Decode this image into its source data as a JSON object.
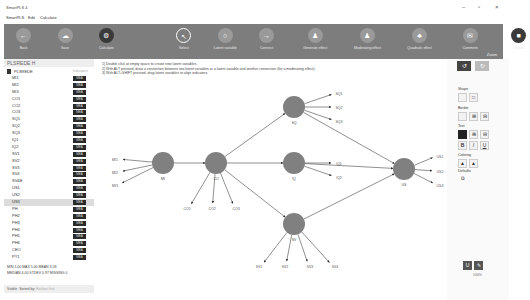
{
  "window": {
    "title": "SmartPLS 4",
    "controls": [
      "minimize",
      "maximize",
      "close"
    ]
  },
  "menu": [
    "SmartPLS",
    "Edit",
    "Calculate"
  ],
  "toolbar": {
    "buttons": [
      {
        "label": "Back",
        "icon": "back"
      },
      {
        "label": "Save",
        "icon": "cloud"
      },
      {
        "label": "Calculate",
        "icon": "gear",
        "dark": true
      },
      {
        "label": "Select",
        "icon": "pointer",
        "selected": true
      },
      {
        "label": "Latent variable",
        "icon": "circle"
      },
      {
        "label": "Connect",
        "icon": "arrow"
      },
      {
        "label": "Generate effect",
        "icon": "person"
      },
      {
        "label": "Moderating effect",
        "icon": "person"
      },
      {
        "label": "Quadratic effect",
        "icon": "group"
      },
      {
        "label": "Comment",
        "icon": "comment"
      },
      {
        "label": "Delete",
        "icon": "trash",
        "dark": true
      }
    ],
    "zoom_label": "Zoom"
  },
  "left": {
    "title": "PLSREDE H",
    "project": "PLSREDE",
    "project_right": "Indicators",
    "indicators": [
      "MI1",
      "MI2",
      "MI3",
      "CO1",
      "CO2",
      "CO3",
      "SQ1",
      "SQ2",
      "SQ3",
      "IQ1",
      "IQ2",
      "SV1",
      "SV2",
      "SV3",
      "SV4",
      "SV&E",
      "US1",
      "US2",
      "US3",
      "PH",
      "PH2",
      "PH3",
      "PH4",
      "PH5",
      "PH6",
      "CEO",
      "PY1"
    ],
    "badge": "MEA",
    "highlighted": "US3",
    "stats": {
      "line1": "MIN 1.00  MAX 5.00  MEAN 3.58",
      "line2": "MEDIAN 4.00  STDEV 0.97  MISSING 0"
    },
    "sort": {
      "visible": "Visible",
      "sorted": "Sorted by:",
      "value": "Earliest first"
    }
  },
  "canvas": {
    "instructions": [
      "1) Double click at empty space to create new latent variables.",
      "2) With ALT pressed, draw a connection between two latent variables or a latent variable and another connection (for a moderating effect).",
      "3) With ALT+SHIFT pressed, drag latent variables to align indicators."
    ],
    "nodes": [
      {
        "id": "MI",
        "x": 68,
        "y": 104
      },
      {
        "id": "CO",
        "x": 121,
        "y": 104
      },
      {
        "id": "SQ",
        "x": 199,
        "y": 48
      },
      {
        "id": "IQ",
        "x": 199,
        "y": 104
      },
      {
        "id": "US",
        "x": 309,
        "y": 110
      },
      {
        "id": "SV",
        "x": 199,
        "y": 165
      }
    ],
    "indicators": [
      {
        "id": "MI1",
        "x": 20,
        "y": 100,
        "lv": "MI"
      },
      {
        "id": "MI2",
        "x": 20,
        "y": 113,
        "lv": "MI"
      },
      {
        "id": "MI3",
        "x": 20,
        "y": 126,
        "lv": "MI"
      },
      {
        "id": "CO1",
        "x": 92,
        "y": 149,
        "lv": "CO"
      },
      {
        "id": "CO2",
        "x": 117,
        "y": 149,
        "lv": "CO"
      },
      {
        "id": "CO3",
        "x": 141,
        "y": 149,
        "lv": "CO"
      },
      {
        "id": "SQ1",
        "x": 244,
        "y": 34,
        "lv": "SQ"
      },
      {
        "id": "SQ2",
        "x": 244,
        "y": 48,
        "lv": "SQ"
      },
      {
        "id": "SQ3",
        "x": 244,
        "y": 62,
        "lv": "SQ"
      },
      {
        "id": "IQ1",
        "x": 244,
        "y": 104,
        "lv": "IQ"
      },
      {
        "id": "IQ2",
        "x": 244,
        "y": 118,
        "lv": "IQ"
      },
      {
        "id": "US1",
        "x": 345,
        "y": 97,
        "lv": "US"
      },
      {
        "id": "US2",
        "x": 345,
        "y": 112,
        "lv": "US"
      },
      {
        "id": "US3",
        "x": 345,
        "y": 126,
        "lv": "US"
      },
      {
        "id": "SV1",
        "x": 164,
        "y": 207,
        "lv": "SV"
      },
      {
        "id": "SV2",
        "x": 190,
        "y": 207,
        "lv": "SV"
      },
      {
        "id": "SV3",
        "x": 215,
        "y": 207,
        "lv": "SV"
      },
      {
        "id": "SV4",
        "x": 240,
        "y": 207,
        "lv": "SV"
      }
    ],
    "paths": [
      [
        "MI",
        "CO"
      ],
      [
        "CO",
        "SQ"
      ],
      [
        "CO",
        "IQ"
      ],
      [
        "CO",
        "SV"
      ],
      [
        "SQ",
        "US"
      ],
      [
        "IQ",
        "US"
      ],
      [
        "SV",
        "US"
      ]
    ]
  },
  "right": {
    "sections": [
      "Shape",
      "Border",
      "Text",
      "Coloring",
      "Defaults"
    ],
    "zoom": "100%"
  }
}
